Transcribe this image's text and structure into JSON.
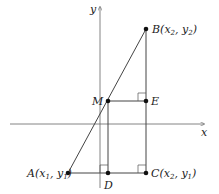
{
  "diagram": {
    "type": "coordinate-geometry-midpoint",
    "axes": {
      "x_label": "x",
      "y_label": "y"
    },
    "points": [
      {
        "id": "A",
        "label": "A",
        "coords": "(x1, y1)",
        "sub1": "1",
        "sub2": "1",
        "px": 68,
        "py": 173
      },
      {
        "id": "B",
        "label": "B",
        "coords": "(x2, y2)",
        "sub1": "2",
        "sub2": "2",
        "px": 146,
        "py": 29
      },
      {
        "id": "C",
        "label": "C",
        "coords": "(x2, y1)",
        "sub1": "2",
        "sub2": "1",
        "px": 146,
        "py": 173
      },
      {
        "id": "D",
        "label": "D",
        "px": 108,
        "py": 173
      },
      {
        "id": "E",
        "label": "E",
        "px": 146,
        "py": 101
      },
      {
        "id": "M",
        "label": "M",
        "px": 108,
        "py": 101
      }
    ],
    "segments": [
      "AB",
      "AC",
      "BC",
      "MD",
      "ME"
    ],
    "right_angle_marks": [
      "C",
      "D",
      "E"
    ],
    "colors": {
      "line": "#444444",
      "axis": "#666666",
      "point": "#111111",
      "text": "#222222"
    }
  }
}
